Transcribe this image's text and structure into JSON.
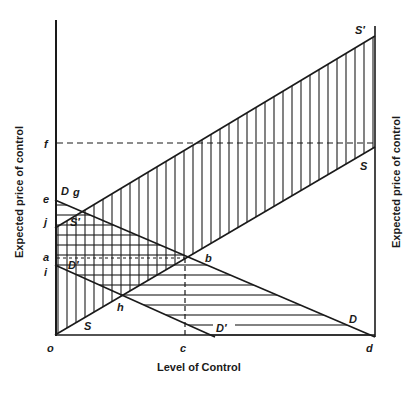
{
  "diagram": {
    "x_axis_label": "Level of Control",
    "y_axis_label_left": "Expected price of control",
    "y_axis_label_right": "Expected price of control",
    "curves": {
      "S_prime": "S′",
      "S": "S",
      "D": "D",
      "D_prime": "D′",
      "S_prime_left": "S′",
      "D_prime_left": "D′",
      "S_lower": "S",
      "D_left": "D"
    },
    "points": {
      "o": "o",
      "c": "c",
      "d": "d",
      "f": "f",
      "e": "e",
      "j": "j",
      "a": "a",
      "i": "i",
      "g": "g",
      "b": "b",
      "h": "h"
    },
    "colors": {
      "ink": "#1a1a1a",
      "background": "#ffffff"
    }
  }
}
